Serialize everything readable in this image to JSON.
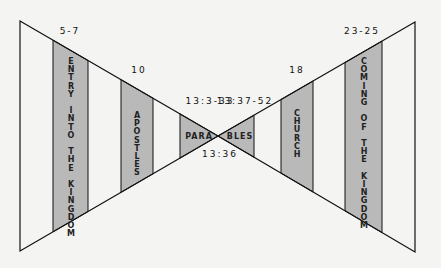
{
  "colors": {
    "band_fill": "#b9b9b9",
    "line": "#111111",
    "background": "#f4f4f2"
  },
  "left_bands": [
    {
      "ref": "5-7",
      "text": [
        "E",
        "N",
        "T",
        "R",
        "Y",
        "",
        "I",
        "N",
        "T",
        "O",
        "",
        "T",
        "H",
        "E",
        "",
        "K",
        "I",
        "N",
        "G",
        "D",
        "O",
        "M"
      ]
    },
    {
      "ref": "10",
      "text": [
        "A",
        "P",
        "O",
        "S",
        "T",
        "L",
        "E",
        "S"
      ]
    },
    {
      "ref": "13:3-33",
      "text": "PARA"
    }
  ],
  "right_bands": [
    {
      "ref": "13:37-52",
      "text": "BLES"
    },
    {
      "ref": "18",
      "text": [
        "C",
        "H",
        "U",
        "R",
        "C",
        "H"
      ]
    },
    {
      "ref": "23-25",
      "text": [
        "C",
        "O",
        "M",
        "I",
        "N",
        "G",
        "",
        "O",
        "F",
        "",
        "T",
        "H",
        "E",
        "",
        "K",
        "I",
        "N",
        "G",
        "D",
        "O",
        "M"
      ]
    }
  ],
  "center_ref": "13:36"
}
